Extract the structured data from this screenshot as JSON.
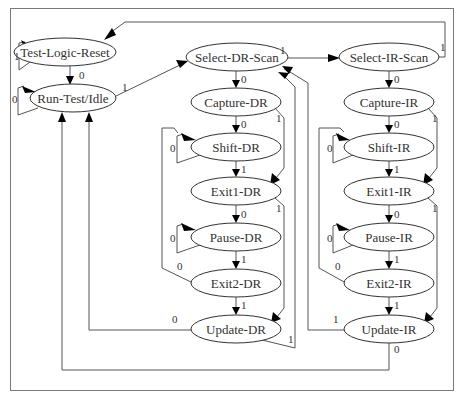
{
  "diagram": {
    "colors": {
      "line": "#555555",
      "node_stroke": "#333333",
      "frame": "#7a7a7a",
      "arrow": "#000000",
      "text": "#333333"
    },
    "nodes": [
      {
        "id": "tlr",
        "label": "Test-Logic-Reset",
        "cx": 65,
        "cy": 52,
        "rx": 51,
        "ry": 14
      },
      {
        "id": "rti",
        "label": "Run-Test/Idle",
        "cx": 73,
        "cy": 98,
        "rx": 43,
        "ry": 14
      },
      {
        "id": "sdr",
        "label": "Select-DR-Scan",
        "cx": 237,
        "cy": 57,
        "rx": 51,
        "ry": 14
      },
      {
        "id": "cdr",
        "label": "Capture-DR",
        "cx": 236,
        "cy": 102,
        "rx": 45,
        "ry": 14
      },
      {
        "id": "shdr",
        "label": "Shift-DR",
        "cx": 236,
        "cy": 147,
        "rx": 45,
        "ry": 14
      },
      {
        "id": "e1dr",
        "label": "Exit1-DR",
        "cx": 236,
        "cy": 191,
        "rx": 45,
        "ry": 14
      },
      {
        "id": "pdr",
        "label": "Pause-DR",
        "cx": 236,
        "cy": 237,
        "rx": 45,
        "ry": 14
      },
      {
        "id": "e2dr",
        "label": "Exit2-DR",
        "cx": 236,
        "cy": 283,
        "rx": 45,
        "ry": 14
      },
      {
        "id": "udr",
        "label": "Update-DR",
        "cx": 236,
        "cy": 329,
        "rx": 45,
        "ry": 14
      },
      {
        "id": "sir",
        "label": "Select-IR-Scan",
        "cx": 389,
        "cy": 57,
        "rx": 50,
        "ry": 14
      },
      {
        "id": "cir",
        "label": "Capture-IR",
        "cx": 389,
        "cy": 102,
        "rx": 45,
        "ry": 14
      },
      {
        "id": "shir",
        "label": "Shift-IR",
        "cx": 389,
        "cy": 147,
        "rx": 45,
        "ry": 14
      },
      {
        "id": "e1ir",
        "label": "Exit1-IR",
        "cx": 389,
        "cy": 191,
        "rx": 45,
        "ry": 14
      },
      {
        "id": "pir",
        "label": "Pause-IR",
        "cx": 389,
        "cy": 237,
        "rx": 45,
        "ry": 14
      },
      {
        "id": "e2ir",
        "label": "Exit2-IR",
        "cx": 389,
        "cy": 283,
        "rx": 45,
        "ry": 14
      },
      {
        "id": "uir",
        "label": "Update-IR",
        "cx": 389,
        "cy": 329,
        "rx": 45,
        "ry": 14
      }
    ],
    "edges": [
      {
        "from": "Test-Logic-Reset",
        "to": "Test-Logic-Reset",
        "label": "1",
        "lx": 14,
        "ly": 60
      },
      {
        "from": "Test-Logic-Reset",
        "to": "Run-Test/Idle",
        "label": "0",
        "lx": 79,
        "ly": 79
      },
      {
        "from": "Run-Test/Idle",
        "to": "Run-Test/Idle",
        "label": "0",
        "lx": 12,
        "ly": 103
      },
      {
        "from": "Run-Test/Idle",
        "to": "Select-DR-Scan",
        "label": "1",
        "lx": 122,
        "ly": 91
      },
      {
        "from": "Select-DR-Scan",
        "to": "Capture-DR",
        "label": "0",
        "lx": 241,
        "ly": 83
      },
      {
        "from": "Select-DR-Scan",
        "to": "Select-IR-Scan",
        "label": "1",
        "lx": 280,
        "ly": 54
      },
      {
        "from": "Capture-DR",
        "to": "Shift-DR",
        "label": "0",
        "lx": 241,
        "ly": 128
      },
      {
        "from": "Capture-DR",
        "to": "Exit1-DR",
        "label": "1",
        "lx": 276,
        "ly": 122
      },
      {
        "from": "Shift-DR",
        "to": "Shift-DR",
        "label": "0",
        "lx": 170,
        "ly": 152
      },
      {
        "from": "Shift-DR",
        "to": "Exit1-DR",
        "label": "1",
        "lx": 241,
        "ly": 173
      },
      {
        "from": "Exit1-DR",
        "to": "Pause-DR",
        "label": "0",
        "lx": 241,
        "ly": 218
      },
      {
        "from": "Exit1-DR",
        "to": "Update-DR",
        "label": "1",
        "lx": 276,
        "ly": 212
      },
      {
        "from": "Pause-DR",
        "to": "Pause-DR",
        "label": "0",
        "lx": 170,
        "ly": 242
      },
      {
        "from": "Pause-DR",
        "to": "Exit2-DR",
        "label": "1",
        "lx": 241,
        "ly": 263
      },
      {
        "from": "Exit2-DR",
        "to": "Shift-DR",
        "label": "0",
        "lx": 177,
        "ly": 270
      },
      {
        "from": "Exit2-DR",
        "to": "Update-DR",
        "label": "1",
        "lx": 241,
        "ly": 309
      },
      {
        "from": "Update-DR",
        "to": "Run-Test/Idle",
        "label": "0",
        "lx": 172,
        "ly": 323
      },
      {
        "from": "Update-DR",
        "to": "Select-DR-Scan",
        "label": "1",
        "lx": 288,
        "ly": 343
      },
      {
        "from": "Select-IR-Scan",
        "to": "Capture-IR",
        "label": "0",
        "lx": 394,
        "ly": 83
      },
      {
        "from": "Select-IR-Scan",
        "to": "Test-Logic-Reset",
        "label": "1",
        "lx": 440,
        "ly": 51
      },
      {
        "from": "Capture-IR",
        "to": "Shift-IR",
        "label": "0",
        "lx": 394,
        "ly": 128
      },
      {
        "from": "Capture-IR",
        "to": "Exit1-IR",
        "label": "1",
        "lx": 432,
        "ly": 122
      },
      {
        "from": "Shift-IR",
        "to": "Shift-IR",
        "label": "0",
        "lx": 327,
        "ly": 152
      },
      {
        "from": "Shift-IR",
        "to": "Exit1-IR",
        "label": "1",
        "lx": 394,
        "ly": 173
      },
      {
        "from": "Exit1-IR",
        "to": "Pause-IR",
        "label": "0",
        "lx": 394,
        "ly": 218
      },
      {
        "from": "Exit1-IR",
        "to": "Update-IR",
        "label": "1",
        "lx": 432,
        "ly": 212
      },
      {
        "from": "Pause-IR",
        "to": "Pause-IR",
        "label": "0",
        "lx": 327,
        "ly": 242
      },
      {
        "from": "Pause-IR",
        "to": "Exit2-IR",
        "label": "1",
        "lx": 394,
        "ly": 263
      },
      {
        "from": "Exit2-IR",
        "to": "Shift-IR",
        "label": "0",
        "lx": 335,
        "ly": 270
      },
      {
        "from": "Exit2-IR",
        "to": "Update-IR",
        "label": "1",
        "lx": 394,
        "ly": 309
      },
      {
        "from": "Update-IR",
        "to": "Select-DR-Scan",
        "label": "1",
        "lx": 333,
        "ly": 323
      },
      {
        "from": "Update-IR",
        "to": "Run-Test/Idle",
        "label": "0",
        "lx": 394,
        "ly": 353
      }
    ]
  }
}
